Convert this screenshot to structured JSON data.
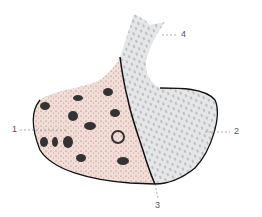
{
  "figure": {
    "labels": [
      {
        "id": "1",
        "text": "1"
      },
      {
        "id": "2",
        "text": "2"
      },
      {
        "id": "3",
        "text": "3"
      },
      {
        "id": "4",
        "text": "4"
      }
    ],
    "colors": {
      "left_lobe": "#f3ddd6",
      "right_lobe": "#e4e6e8",
      "outline": "#111111",
      "leader": "#777777"
    }
  }
}
